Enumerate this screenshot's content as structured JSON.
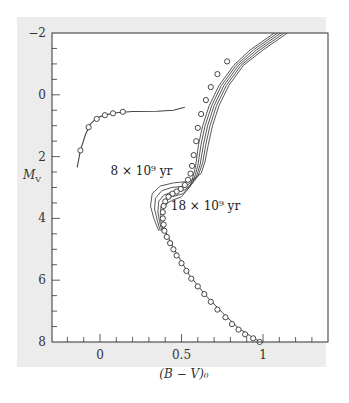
{
  "chart_data": {
    "type": "scatter",
    "title": "",
    "xlabel": "(B − V)₀",
    "ylabel": "M_V",
    "xlim": [
      -0.3,
      1.4
    ],
    "ylim": [
      8,
      -2
    ],
    "y_inverted": true,
    "grid": false,
    "x_ticks": [
      {
        "value": 0,
        "label": "0"
      },
      {
        "value": 0.5,
        "label": "0.5"
      },
      {
        "value": 1,
        "label": "1"
      }
    ],
    "x_minor_step": 0.1,
    "y_ticks": [
      {
        "value": -2,
        "label": "−2"
      },
      {
        "value": 0,
        "label": "0"
      },
      {
        "value": 2,
        "label": "2"
      },
      {
        "value": 4,
        "label": "4"
      },
      {
        "value": 6,
        "label": "6"
      },
      {
        "value": 8,
        "label": "8"
      }
    ],
    "y_minor_step": 0.5,
    "annotations": [
      {
        "text": "8 × 10⁹ yr",
        "x": 0.15,
        "y": 2.45
      },
      {
        "text": "18 × 10⁹ yr",
        "x": 0.52,
        "y": 3.6
      }
    ],
    "series": [
      {
        "name": "Horizontal branch observations",
        "kind": "points",
        "points": [
          [
            -0.12,
            1.8
          ],
          [
            -0.07,
            1.05
          ],
          [
            -0.02,
            0.78
          ],
          [
            0.03,
            0.66
          ],
          [
            0.08,
            0.6
          ],
          [
            0.14,
            0.55
          ]
        ]
      },
      {
        "name": "Horizontal branch model",
        "kind": "line",
        "points": [
          [
            -0.14,
            2.35
          ],
          [
            -0.12,
            1.8
          ],
          [
            -0.09,
            1.3
          ],
          [
            -0.06,
            0.95
          ],
          [
            -0.02,
            0.75
          ],
          [
            0.03,
            0.65
          ],
          [
            0.1,
            0.58
          ],
          [
            0.2,
            0.54
          ],
          [
            0.35,
            0.53
          ],
          [
            0.45,
            0.5
          ],
          [
            0.52,
            0.4
          ]
        ]
      },
      {
        "name": "Giant & main-sequence observations",
        "kind": "points",
        "points": [
          [
            0.78,
            -1.08
          ],
          [
            0.72,
            -0.67
          ],
          [
            0.68,
            -0.25
          ],
          [
            0.65,
            0.17
          ],
          [
            0.62,
            0.62
          ],
          [
            0.6,
            1.07
          ],
          [
            0.59,
            1.5
          ],
          [
            0.575,
            1.95
          ],
          [
            0.565,
            2.3
          ],
          [
            0.555,
            2.55
          ],
          [
            0.54,
            2.75
          ],
          [
            0.52,
            2.92
          ],
          [
            0.495,
            3.05
          ],
          [
            0.47,
            3.13
          ],
          [
            0.445,
            3.2
          ],
          [
            0.42,
            3.3
          ],
          [
            0.4,
            3.45
          ],
          [
            0.39,
            3.6
          ],
          [
            0.385,
            3.8
          ],
          [
            0.385,
            4.0
          ],
          [
            0.39,
            4.2
          ],
          [
            0.395,
            4.4
          ],
          [
            0.41,
            4.6
          ],
          [
            0.43,
            4.8
          ],
          [
            0.45,
            5.0
          ],
          [
            0.47,
            5.2
          ],
          [
            0.5,
            5.45
          ],
          [
            0.53,
            5.7
          ],
          [
            0.56,
            5.95
          ],
          [
            0.6,
            6.2
          ],
          [
            0.64,
            6.45
          ],
          [
            0.68,
            6.7
          ],
          [
            0.72,
            6.95
          ],
          [
            0.77,
            7.2
          ],
          [
            0.81,
            7.42
          ],
          [
            0.85,
            7.6
          ],
          [
            0.89,
            7.75
          ],
          [
            0.94,
            7.88
          ],
          [
            0.98,
            8.0
          ]
        ]
      }
    ],
    "isochrones": [
      {
        "label": "8 × 10⁹ yr",
        "points": [
          [
            1.15,
            -2
          ],
          [
            1.0,
            -1.45
          ],
          [
            0.88,
            -0.95
          ],
          [
            0.79,
            -0.3
          ],
          [
            0.73,
            0.35
          ],
          [
            0.69,
            1.0
          ],
          [
            0.665,
            1.6
          ],
          [
            0.645,
            2.15
          ],
          [
            0.62,
            2.55
          ],
          [
            0.55,
            2.8
          ],
          [
            0.45,
            2.85
          ],
          [
            0.37,
            2.95
          ],
          [
            0.32,
            3.2
          ],
          [
            0.31,
            3.6
          ],
          [
            0.33,
            4.0
          ],
          [
            0.36,
            4.4
          ]
        ]
      },
      {
        "label": "",
        "points": [
          [
            1.13,
            -2
          ],
          [
            0.98,
            -1.45
          ],
          [
            0.865,
            -0.95
          ],
          [
            0.775,
            -0.3
          ],
          [
            0.715,
            0.35
          ],
          [
            0.675,
            1.0
          ],
          [
            0.65,
            1.6
          ],
          [
            0.63,
            2.2
          ],
          [
            0.6,
            2.65
          ],
          [
            0.53,
            2.95
          ],
          [
            0.44,
            3.0
          ],
          [
            0.38,
            3.1
          ],
          [
            0.34,
            3.35
          ],
          [
            0.335,
            3.7
          ],
          [
            0.35,
            4.05
          ],
          [
            0.37,
            4.4
          ]
        ]
      },
      {
        "label": "",
        "points": [
          [
            1.11,
            -2
          ],
          [
            0.96,
            -1.45
          ],
          [
            0.85,
            -0.95
          ],
          [
            0.76,
            -0.3
          ],
          [
            0.7,
            0.35
          ],
          [
            0.66,
            1.0
          ],
          [
            0.635,
            1.6
          ],
          [
            0.615,
            2.25
          ],
          [
            0.585,
            2.75
          ],
          [
            0.52,
            3.08
          ],
          [
            0.44,
            3.15
          ],
          [
            0.39,
            3.25
          ],
          [
            0.36,
            3.45
          ],
          [
            0.355,
            3.8
          ],
          [
            0.365,
            4.1
          ],
          [
            0.38,
            4.4
          ]
        ]
      },
      {
        "label": "",
        "points": [
          [
            1.09,
            -2
          ],
          [
            0.94,
            -1.45
          ],
          [
            0.835,
            -0.95
          ],
          [
            0.745,
            -0.3
          ],
          [
            0.685,
            0.35
          ],
          [
            0.645,
            1.0
          ],
          [
            0.62,
            1.6
          ],
          [
            0.6,
            2.3
          ],
          [
            0.57,
            2.85
          ],
          [
            0.51,
            3.2
          ],
          [
            0.44,
            3.3
          ],
          [
            0.4,
            3.4
          ],
          [
            0.375,
            3.6
          ],
          [
            0.37,
            3.9
          ],
          [
            0.375,
            4.15
          ],
          [
            0.39,
            4.4
          ]
        ]
      },
      {
        "label": "18 × 10⁹ yr",
        "points": [
          [
            1.07,
            -2
          ],
          [
            0.92,
            -1.45
          ],
          [
            0.82,
            -0.95
          ],
          [
            0.73,
            -0.3
          ],
          [
            0.67,
            0.35
          ],
          [
            0.63,
            1.0
          ],
          [
            0.605,
            1.6
          ],
          [
            0.585,
            2.35
          ],
          [
            0.555,
            2.95
          ],
          [
            0.5,
            3.3
          ],
          [
            0.44,
            3.42
          ],
          [
            0.41,
            3.52
          ],
          [
            0.39,
            3.7
          ],
          [
            0.385,
            3.95
          ],
          [
            0.39,
            4.2
          ],
          [
            0.4,
            4.4
          ]
        ]
      }
    ],
    "main_sequence_line": [
      [
        0.4,
        4.4
      ],
      [
        0.45,
        4.95
      ],
      [
        0.55,
        5.85
      ],
      [
        0.65,
        6.5
      ],
      [
        0.75,
        7.05
      ],
      [
        0.85,
        7.55
      ],
      [
        0.95,
        7.9
      ],
      [
        0.99,
        8.0
      ]
    ],
    "colors": {
      "frame": "#333333",
      "curve": "#444444",
      "marker_fill": "#ffffff",
      "panel_bg": "#ececec",
      "plot_bg": "#ffffff"
    }
  }
}
